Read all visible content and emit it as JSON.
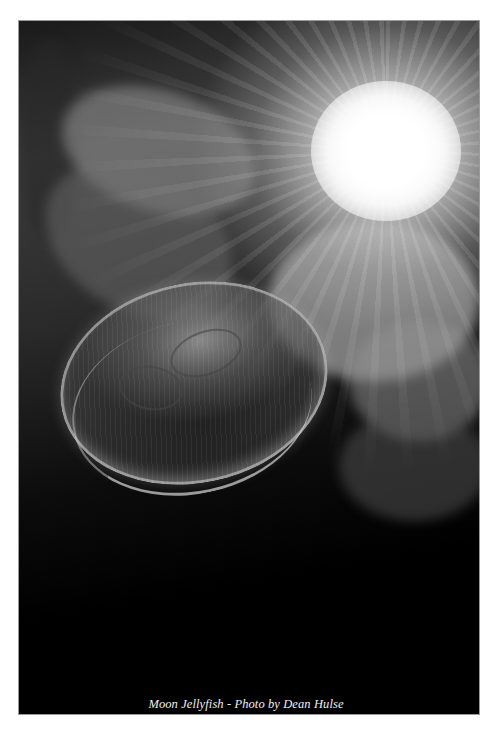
{
  "image": {
    "subject": "Moon jellyfish underwater with sunburst",
    "tone": "black-and-white",
    "caption": "Moon Jellyfish - Photo by Dean Hulse"
  },
  "top_text_fragment": "",
  "colors": {
    "page_background": "#ffffff",
    "photo_frame_border": "#9a9a9a",
    "caption_text": "#f0f0f0"
  }
}
